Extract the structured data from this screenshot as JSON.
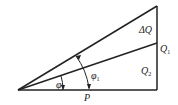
{
  "diagram": {
    "type": "power-triangle",
    "line_color": "#222222",
    "labels": {
      "delta_q": "ΔQ",
      "q1_main": "Q",
      "q1_sub": "1",
      "q2_main": "Q",
      "q2_sub": "2",
      "p": "P",
      "phi1_main": "φ",
      "phi1_sub": "1",
      "phi2_main": "φ",
      "phi2_sub": "2"
    }
  }
}
